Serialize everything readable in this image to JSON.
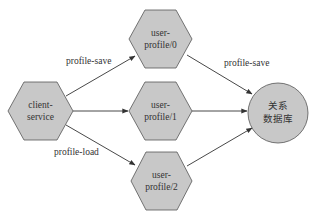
{
  "diagram": {
    "colors": {
      "node_fill": "#c8c8c8",
      "node_stroke": "#555555",
      "edge": "#333333",
      "background": "#ffffff"
    },
    "nodes": {
      "client": {
        "line1": "client-",
        "line2": "service",
        "shape": "hexagon"
      },
      "up0": {
        "line1": "user-",
        "line2": "profile/0",
        "shape": "hexagon"
      },
      "up1": {
        "line1": "user-",
        "line2": "profile/1",
        "shape": "hexagon"
      },
      "up2": {
        "line1": "user-",
        "line2": "profile/2",
        "shape": "hexagon"
      },
      "db": {
        "line1": "关系",
        "line2": "数据库",
        "shape": "circle"
      }
    },
    "edges": [
      {
        "from": "client-service",
        "to": "user-profile/0",
        "label": "profile-save"
      },
      {
        "from": "client-service",
        "to": "user-profile/1",
        "label": ""
      },
      {
        "from": "client-service",
        "to": "user-profile/2",
        "label": "profile-load"
      },
      {
        "from": "user-profile/0",
        "to": "关系数据库",
        "label": "profile-save"
      },
      {
        "from": "user-profile/1",
        "to": "关系数据库",
        "label": ""
      },
      {
        "from": "user-profile/2",
        "to": "关系数据库",
        "label": ""
      }
    ],
    "edge_labels": {
      "client_up0": "profile-save",
      "client_up2": "profile-load",
      "up0_db": "profile-save"
    }
  }
}
